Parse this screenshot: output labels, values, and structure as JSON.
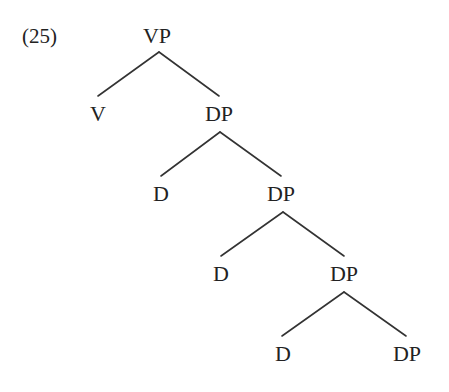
{
  "example": {
    "number": "(25)"
  },
  "tree": {
    "nodes": [
      {
        "id": "vp",
        "label": "VP",
        "x": 157,
        "y": 25
      },
      {
        "id": "v",
        "label": "V",
        "x": 98,
        "y": 103
      },
      {
        "id": "dp1",
        "label": "DP",
        "x": 219,
        "y": 103
      },
      {
        "id": "d1",
        "label": "D",
        "x": 161,
        "y": 183
      },
      {
        "id": "dp2",
        "label": "DP",
        "x": 281,
        "y": 183
      },
      {
        "id": "d2",
        "label": "D",
        "x": 221,
        "y": 263
      },
      {
        "id": "dp3",
        "label": "DP",
        "x": 344,
        "y": 263
      },
      {
        "id": "d3",
        "label": "D",
        "x": 283,
        "y": 343
      },
      {
        "id": "dp4",
        "label": "DP",
        "x": 407,
        "y": 343
      }
    ],
    "edges": [
      {
        "from": "vp",
        "to": "v",
        "x1": 159,
        "y1": 52,
        "x2": 98,
        "y2": 96
      },
      {
        "from": "vp",
        "to": "dp1",
        "x1": 159,
        "y1": 52,
        "x2": 219,
        "y2": 96
      },
      {
        "from": "dp1",
        "to": "d1",
        "x1": 220,
        "y1": 132,
        "x2": 161,
        "y2": 176
      },
      {
        "from": "dp1",
        "to": "dp2",
        "x1": 220,
        "y1": 132,
        "x2": 281,
        "y2": 176
      },
      {
        "from": "dp2",
        "to": "d2",
        "x1": 283,
        "y1": 212,
        "x2": 221,
        "y2": 256
      },
      {
        "from": "dp2",
        "to": "dp3",
        "x1": 283,
        "y1": 212,
        "x2": 344,
        "y2": 256
      },
      {
        "from": "dp3",
        "to": "d3",
        "x1": 344,
        "y1": 292,
        "x2": 282,
        "y2": 336
      },
      {
        "from": "dp3",
        "to": "dp4",
        "x1": 344,
        "y1": 292,
        "x2": 406,
        "y2": 336
      }
    ]
  }
}
